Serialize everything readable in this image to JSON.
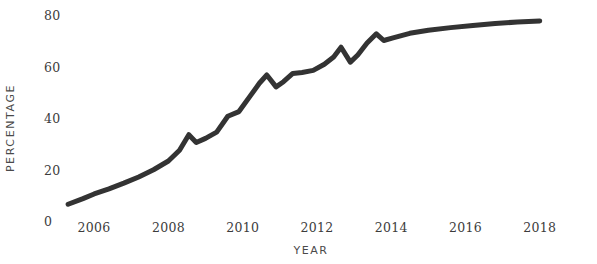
{
  "chart_data": {
    "type": "line",
    "title": "",
    "subtitle": "",
    "xlabel": "YEAR",
    "ylabel": "PERCENTAGE",
    "xlim": [
      2005.0,
      2018.6
    ],
    "ylim": [
      0,
      80
    ],
    "xticks": [
      2006,
      2008,
      2010,
      2012,
      2014,
      2016,
      2018
    ],
    "xtick_labels": [
      "2006",
      "2008",
      "2010",
      "2012",
      "2014",
      "2016",
      "2018"
    ],
    "yticks": [
      0,
      20,
      40,
      60,
      80
    ],
    "ytick_labels": [
      "0",
      "20",
      "40",
      "60",
      "80"
    ],
    "grid": true,
    "grid_axis": "y",
    "legend": false,
    "legend_position": "none",
    "annotations": [],
    "series": [
      {
        "name": "Percentage",
        "color": "#333333",
        "line_width": 5,
        "x": [
          2005.3,
          2005.7,
          2006.0,
          2006.4,
          2006.8,
          2007.2,
          2007.6,
          2008.0,
          2008.3,
          2008.55,
          2008.75,
          2009.0,
          2009.3,
          2009.6,
          2009.9,
          2010.2,
          2010.45,
          2010.65,
          2010.9,
          2011.1,
          2011.35,
          2011.6,
          2011.9,
          2012.2,
          2012.45,
          2012.65,
          2012.9,
          2013.1,
          2013.35,
          2013.6,
          2013.8,
          2014.05,
          2014.5,
          2015.0,
          2015.6,
          2016.2,
          2016.8,
          2017.4,
          2018.0
        ],
        "y": [
          3.0,
          5.2,
          7.0,
          9.0,
          11.2,
          13.6,
          16.4,
          19.8,
          24.0,
          30.0,
          27.0,
          28.6,
          31.0,
          37.2,
          39.0,
          45.0,
          50.0,
          53.2,
          48.6,
          50.6,
          53.8,
          54.2,
          55.0,
          57.4,
          60.2,
          64.0,
          58.2,
          61.0,
          65.6,
          69.2,
          66.6,
          67.6,
          69.4,
          70.6,
          71.6,
          72.4,
          73.2,
          73.8,
          74.2
        ]
      }
    ]
  },
  "axes": {
    "y_label_text": "PERCENTAGE",
    "x_label_text": "YEAR"
  },
  "style": {
    "line_color": "#333333",
    "grid_color": "#d8d8d8",
    "text_color": "#3c3c3c",
    "background": "#ffffff"
  }
}
